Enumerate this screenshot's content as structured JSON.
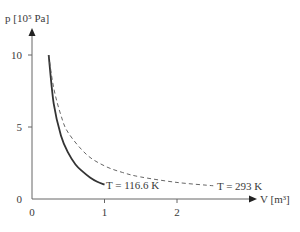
{
  "chart_data": {
    "type": "line",
    "title": "",
    "xlabel": "V [m³]",
    "ylabel": "p [10⁵ Pa]",
    "xlim": [
      0,
      2.9
    ],
    "ylim": [
      0,
      11
    ],
    "x_ticks": [
      0,
      1,
      2
    ],
    "y_ticks": [
      0,
      5,
      10
    ],
    "grid": false,
    "legend": "none (inline labels)",
    "series": [
      {
        "name": "T = 116.6 K",
        "style": "solid",
        "color": "#333333",
        "x": [
          0.23,
          0.3,
          0.4,
          0.5,
          0.6,
          0.7,
          0.8,
          0.9,
          1.0
        ],
        "y": [
          10.0,
          6.6,
          4.4,
          3.2,
          2.4,
          1.9,
          1.5,
          1.2,
          1.0
        ]
      },
      {
        "name": "T = 293 K",
        "style": "dashed",
        "color": "#555555",
        "x": [
          0.23,
          0.3,
          0.4,
          0.5,
          0.75,
          1.0,
          1.25,
          1.5,
          2.0,
          2.5
        ],
        "y": [
          10.0,
          7.7,
          5.8,
          4.6,
          3.1,
          2.3,
          1.84,
          1.53,
          1.15,
          0.92
        ]
      }
    ],
    "annotations": [
      {
        "text": "T = 116.6 K",
        "x": 1.02,
        "y": 1.0
      },
      {
        "text": "T = 293 K",
        "x": 2.55,
        "y": 0.92
      }
    ]
  }
}
